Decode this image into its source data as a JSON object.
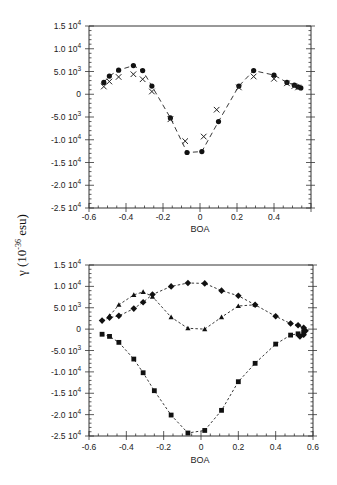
{
  "figure": {
    "shared_ylabel": "γ (10⁻³⁶ esu)",
    "ylabel_main": "γ (10",
    "ylabel_exp": "-36",
    "ylabel_tail": " esu)"
  },
  "chart_data": [
    {
      "type": "scatter",
      "title": "",
      "xlabel": "BOA",
      "ylabel": "γ (10^-36 esu)",
      "xlim": [
        -0.6,
        0.6
      ],
      "ylim": [
        -25000,
        15000
      ],
      "grid": false,
      "x_ticks": [
        "-0.6",
        "-0.4",
        "-0.2",
        "0",
        "0.2",
        "0.4"
      ],
      "y_ticks": [
        "1.5 10^4",
        "1.0 10^4",
        "5.0 10^3",
        "0",
        "-5.0 10^3",
        "-1.0 10^4",
        "-1.5 10^4",
        "-2.0 10^4",
        "-2.5 10^4"
      ],
      "legend": null,
      "series": [
        {
          "name": "circles",
          "marker": "circle",
          "line": "dashed",
          "x": [
            -0.52,
            -0.49,
            -0.44,
            -0.36,
            -0.31,
            -0.26,
            -0.16,
            -0.07,
            0.01,
            0.1,
            0.21,
            0.29,
            0.4,
            0.47,
            0.51,
            0.53,
            0.545
          ],
          "y": [
            2600,
            4000,
            5300,
            6300,
            5200,
            1800,
            -5200,
            -12800,
            -12600,
            -6000,
            1800,
            5200,
            4200,
            2600,
            2000,
            1600,
            1400
          ]
        },
        {
          "name": "crosses",
          "marker": "x",
          "line": "none",
          "x": [
            -0.52,
            -0.49,
            -0.44,
            -0.36,
            -0.31,
            -0.26,
            -0.16,
            -0.08,
            0.02,
            0.09,
            0.21,
            0.29,
            0.4,
            0.47,
            0.51,
            0.53
          ],
          "y": [
            1700,
            2800,
            3800,
            4400,
            3300,
            600,
            -5500,
            -10300,
            -9300,
            -3400,
            1500,
            3900,
            3400,
            2400,
            1800,
            1500
          ]
        }
      ]
    },
    {
      "type": "scatter",
      "title": "",
      "xlabel": "BOA",
      "ylabel": "γ (10^-36 esu)",
      "xlim": [
        -0.6,
        0.6
      ],
      "ylim": [
        -25000,
        15000
      ],
      "grid": false,
      "x_ticks": [
        "-0.6",
        "-0.4",
        "-0.2",
        "0",
        "0.2",
        "0.4",
        "0.6"
      ],
      "y_ticks": [
        "1.5 10^4",
        "1.0 10^4",
        "5.0 10^3",
        "0",
        "-5.0 10^3",
        "-1.0 10^4",
        "-1.5 10^4",
        "-2.0 10^4",
        "-2.5 10^4"
      ],
      "legend": null,
      "series": [
        {
          "name": "diamonds",
          "marker": "diamond",
          "line": "dashed",
          "x": [
            -0.53,
            -0.49,
            -0.44,
            -0.36,
            -0.31,
            -0.26,
            -0.16,
            -0.07,
            0.02,
            0.11,
            0.2,
            0.29,
            0.4,
            0.48,
            0.52,
            0.55,
            0.56,
            0.55,
            0.53
          ],
          "y": [
            2000,
            2700,
            3100,
            4800,
            6300,
            8100,
            10000,
            10800,
            10700,
            9000,
            7800,
            5700,
            3000,
            1300,
            900,
            300,
            -400,
            -1300,
            -1700
          ]
        },
        {
          "name": "triangles",
          "marker": "triangle",
          "line": "dashed",
          "x": [
            -0.49,
            -0.44,
            -0.36,
            -0.31,
            -0.26,
            -0.16,
            -0.07,
            0.02,
            0.11,
            0.2,
            0.29
          ],
          "y": [
            3100,
            5700,
            8000,
            8700,
            7600,
            2800,
            200,
            0,
            2800,
            5400,
            5700
          ]
        },
        {
          "name": "squares",
          "marker": "square",
          "line": "dashed",
          "x": [
            -0.53,
            -0.49,
            -0.44,
            -0.36,
            -0.31,
            -0.25,
            -0.16,
            -0.07,
            0.02,
            0.11,
            0.2,
            0.29,
            0.4,
            0.48,
            0.52,
            0.55
          ],
          "y": [
            -1200,
            -1700,
            -3100,
            -7000,
            -10200,
            -14400,
            -20100,
            -24300,
            -23700,
            -19000,
            -12300,
            -8000,
            -3500,
            -1400,
            -1100,
            -600
          ]
        }
      ]
    }
  ]
}
